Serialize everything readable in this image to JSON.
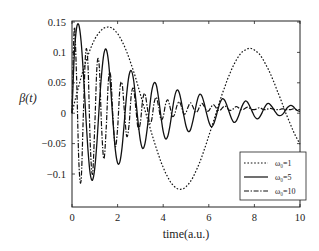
{
  "chart_data": {
    "type": "line",
    "title": "",
    "xlabel": "time(a.u.)",
    "ylabel": "β(t)",
    "xlim": [
      0,
      10
    ],
    "ylim": [
      -0.14,
      0.15
    ],
    "xticks": [
      0,
      2,
      4,
      6,
      8,
      10
    ],
    "xtick_labels": [
      "0",
      "2",
      "4",
      "6",
      "8",
      "10"
    ],
    "yticks": [
      -0.1,
      -0.05,
      0,
      0.05,
      0.1,
      0.15
    ],
    "ytick_labels": [
      "−0.1",
      "−0.05",
      "0",
      "0.05",
      "0.1",
      "0.15"
    ],
    "grid": false,
    "legend_position": "lower right",
    "x": [
      0,
      0.1,
      0.2,
      0.3,
      0.4,
      0.5,
      0.6,
      0.7,
      0.8,
      0.9,
      1.0,
      1.1,
      1.2,
      1.3,
      1.4,
      1.5,
      1.6,
      1.7,
      1.8,
      1.9,
      2.0,
      2.1,
      2.2,
      2.3,
      2.4,
      2.5,
      2.6,
      2.7,
      2.8,
      2.9,
      3.0,
      3.1,
      3.2,
      3.3,
      3.4,
      3.5,
      3.6,
      3.7,
      3.8,
      3.9,
      4.0,
      4.1,
      4.2,
      4.3,
      4.4,
      4.5,
      4.6,
      4.7,
      4.8,
      4.9,
      5.0,
      5.1,
      5.2,
      5.3,
      5.4,
      5.5,
      5.6,
      5.7,
      5.8,
      5.9,
      6.0,
      6.1,
      6.2,
      6.3,
      6.4,
      6.5,
      6.6,
      6.7,
      6.8,
      6.9,
      7.0,
      7.1,
      7.2,
      7.3,
      7.4,
      7.5,
      7.6,
      7.7,
      7.8,
      7.9,
      8.0,
      8.1,
      8.2,
      8.3,
      8.4,
      8.5,
      8.6,
      8.7,
      8.8,
      8.9,
      9.0,
      9.1,
      9.2,
      9.3,
      9.4,
      9.5,
      9.6,
      9.7,
      9.8,
      9.9,
      10.0
    ],
    "series": [
      {
        "name": "ω₀=1",
        "style": "dotted",
        "values": [
          0.0,
          0.016,
          0.031,
          0.045,
          0.059,
          0.072,
          0.084,
          0.095,
          0.105,
          0.114,
          0.122,
          0.128,
          0.133,
          0.137,
          0.14,
          0.141,
          0.142,
          0.141,
          0.139,
          0.135,
          0.131,
          0.125,
          0.118,
          0.11,
          0.101,
          0.091,
          0.08,
          0.069,
          0.057,
          0.044,
          0.031,
          0.018,
          0.005,
          -0.008,
          -0.021,
          -0.034,
          -0.046,
          -0.058,
          -0.069,
          -0.08,
          -0.089,
          -0.098,
          -0.105,
          -0.112,
          -0.117,
          -0.121,
          -0.124,
          -0.125,
          -0.125,
          -0.124,
          -0.121,
          -0.117,
          -0.112,
          -0.106,
          -0.098,
          -0.09,
          -0.081,
          -0.071,
          -0.06,
          -0.049,
          -0.037,
          -0.026,
          -0.014,
          -0.002,
          0.01,
          0.022,
          0.033,
          0.043,
          0.054,
          0.063,
          0.072,
          0.08,
          0.087,
          0.093,
          0.098,
          0.102,
          0.104,
          0.106,
          0.107,
          0.106,
          0.104,
          0.101,
          0.098,
          0.093,
          0.087,
          0.08,
          0.073,
          0.065,
          0.056,
          0.047,
          0.037,
          0.028,
          0.018,
          0.008,
          -0.002,
          -0.011,
          -0.02,
          -0.029,
          -0.037,
          -0.044,
          -0.051
        ]
      },
      {
        "name": "ω₀=5",
        "style": "solid",
        "values": [
          0.0,
          0.095,
          0.14,
          0.145,
          0.118,
          0.065,
          0.0,
          -0.06,
          -0.1,
          -0.11,
          -0.09,
          -0.045,
          0.015,
          0.065,
          0.098,
          0.105,
          0.085,
          0.04,
          -0.015,
          -0.06,
          -0.082,
          -0.08,
          -0.055,
          -0.012,
          0.032,
          0.062,
          0.07,
          0.055,
          0.022,
          -0.015,
          -0.045,
          -0.058,
          -0.05,
          -0.025,
          0.008,
          0.037,
          0.05,
          0.046,
          0.024,
          -0.005,
          -0.03,
          -0.042,
          -0.038,
          -0.02,
          0.005,
          0.027,
          0.038,
          0.034,
          0.018,
          -0.003,
          -0.021,
          -0.03,
          -0.027,
          -0.013,
          0.005,
          0.022,
          0.031,
          0.028,
          0.016,
          0.0,
          -0.014,
          -0.022,
          -0.019,
          -0.008,
          0.006,
          0.018,
          0.024,
          0.021,
          0.012,
          0.001,
          -0.009,
          -0.015,
          -0.013,
          -0.005,
          0.006,
          0.015,
          0.02,
          0.018,
          0.011,
          0.003,
          -0.005,
          -0.009,
          -0.008,
          -0.002,
          0.006,
          0.013,
          0.016,
          0.014,
          0.009,
          0.003,
          -0.002,
          -0.004,
          -0.003,
          0.001,
          0.007,
          0.011,
          0.013,
          0.011,
          0.007,
          0.004,
          0.003
        ]
      },
      {
        "name": "ω₀=10",
        "style": "dashdot",
        "values": [
          0.0,
          0.14,
          0.06,
          -0.08,
          -0.11,
          0.0,
          0.1,
          0.08,
          -0.05,
          -0.1,
          -0.02,
          0.08,
          0.075,
          -0.025,
          -0.075,
          -0.025,
          0.055,
          0.06,
          -0.01,
          -0.055,
          -0.025,
          0.04,
          0.048,
          0.002,
          -0.038,
          -0.02,
          0.03,
          0.04,
          0.008,
          -0.025,
          -0.015,
          0.022,
          0.032,
          0.01,
          -0.016,
          -0.01,
          0.017,
          0.026,
          0.01,
          -0.01,
          -0.006,
          0.014,
          0.022,
          0.01,
          -0.005,
          -0.002,
          0.012,
          0.019,
          0.011,
          -0.001,
          0.001,
          0.011,
          0.017,
          0.011,
          0.002,
          0.003,
          0.011,
          0.016,
          0.011,
          0.004,
          0.004,
          0.01,
          0.014,
          0.01,
          0.005,
          0.005,
          0.009,
          0.012,
          0.009,
          0.005,
          0.005,
          0.008,
          0.011,
          0.009,
          0.006,
          0.006,
          0.008,
          0.01,
          0.008,
          0.006,
          0.006,
          0.007,
          0.009,
          0.008,
          0.006,
          0.006,
          0.007,
          0.008,
          0.007,
          0.006,
          0.006,
          0.006,
          0.007,
          0.007,
          0.006,
          0.006,
          0.006,
          0.007,
          0.006,
          0.006,
          0.006
        ]
      }
    ],
    "legend": [
      {
        "label": "ω₀=1",
        "style": "dotted"
      },
      {
        "label": "ω₀=5",
        "style": "solid"
      },
      {
        "label": "ω₀=10",
        "style": "dashdot"
      }
    ]
  }
}
